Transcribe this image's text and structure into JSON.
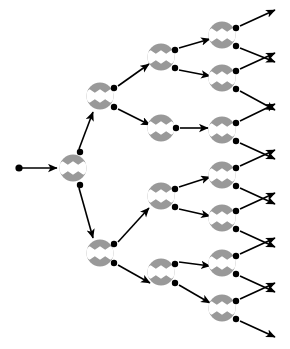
{
  "figure": {
    "width": 290,
    "height": 349,
    "background_color": "#ffffff"
  },
  "style": {
    "node_fill": "#999999",
    "node_band_color": "#ffffff",
    "port_dot_color": "#000000",
    "edge_color": "#000000",
    "node_radius": 13.5,
    "port_dot_radius": 3.2,
    "edge_width": 1.6,
    "band_half_height": 3.2,
    "zigzag_peaks": 3
  },
  "entry": {
    "label": "root-input",
    "dot": {
      "x": 19,
      "y": 168
    },
    "arrow_to": {
      "x": 56,
      "y": 168
    }
  },
  "nodes": [
    {
      "id": "n0",
      "label": "root-node",
      "depth": 0,
      "x": 73,
      "y": 168
    },
    {
      "id": "n1",
      "label": "node-upper",
      "depth": 1,
      "x": 100,
      "y": 96
    },
    {
      "id": "n2",
      "label": "node-lower",
      "depth": 1,
      "x": 100,
      "y": 253
    },
    {
      "id": "n3",
      "label": "node-d2-a",
      "depth": 2,
      "x": 161,
      "y": 57
    },
    {
      "id": "n4",
      "label": "node-d2-b",
      "depth": 2,
      "x": 161,
      "y": 128
    },
    {
      "id": "n5",
      "label": "node-d2-c",
      "depth": 2,
      "x": 161,
      "y": 196
    },
    {
      "id": "n6",
      "label": "node-d2-d",
      "depth": 2,
      "x": 161,
      "y": 272
    },
    {
      "id": "n7",
      "label": "node-leaf-1",
      "depth": 3,
      "x": 222,
      "y": 35
    },
    {
      "id": "n8",
      "label": "node-leaf-2",
      "depth": 3,
      "x": 222,
      "y": 78
    },
    {
      "id": "n9",
      "label": "node-leaf-3",
      "depth": 3,
      "x": 222,
      "y": 130
    },
    {
      "id": "n10",
      "label": "node-leaf-4",
      "depth": 3,
      "x": 222,
      "y": 175
    },
    {
      "id": "n11",
      "label": "node-leaf-5",
      "depth": 3,
      "x": 222,
      "y": 218
    },
    {
      "id": "n12",
      "label": "node-leaf-6",
      "depth": 3,
      "x": 222,
      "y": 263
    },
    {
      "id": "n13",
      "label": "node-leaf-7",
      "depth": 3,
      "x": 222,
      "y": 308
    }
  ],
  "ports": [
    {
      "id": "p0a",
      "label": "root-out-upper",
      "node": "n0",
      "x": 80,
      "y": 152
    },
    {
      "id": "p0b",
      "label": "root-out-lower",
      "node": "n0",
      "x": 80,
      "y": 185
    },
    {
      "id": "p1a",
      "label": "n1-out-upper",
      "node": "n1",
      "x": 114,
      "y": 88
    },
    {
      "id": "p1b",
      "label": "n1-out-lower",
      "node": "n1",
      "x": 114,
      "y": 107
    },
    {
      "id": "p2a",
      "label": "n2-out-upper",
      "node": "n2",
      "x": 114,
      "y": 244
    },
    {
      "id": "p2b",
      "label": "n2-out-lower",
      "node": "n2",
      "x": 114,
      "y": 263
    },
    {
      "id": "p3a",
      "label": "n3-out-upper",
      "node": "n3",
      "x": 175,
      "y": 50
    },
    {
      "id": "p3b",
      "label": "n3-out-lower",
      "node": "n3",
      "x": 175,
      "y": 68
    },
    {
      "id": "p4a",
      "label": "n4-out-single",
      "node": "n4",
      "x": 176,
      "y": 128
    },
    {
      "id": "p5a",
      "label": "n5-out-upper",
      "node": "n5",
      "x": 175,
      "y": 189
    },
    {
      "id": "p5b",
      "label": "n5-out-lower",
      "node": "n5",
      "x": 175,
      "y": 207
    },
    {
      "id": "p6a",
      "label": "n6-out-upper",
      "node": "n6",
      "x": 175,
      "y": 264
    },
    {
      "id": "p6b",
      "label": "n6-out-lower",
      "node": "n6",
      "x": 175,
      "y": 283
    },
    {
      "id": "p7a",
      "label": "n7-out-upper",
      "node": "n7",
      "x": 236,
      "y": 28
    },
    {
      "id": "p7b",
      "label": "n7-out-lower",
      "node": "n7",
      "x": 236,
      "y": 46
    },
    {
      "id": "p8a",
      "label": "n8-out-upper",
      "node": "n8",
      "x": 236,
      "y": 71
    },
    {
      "id": "p8b",
      "label": "n8-out-lower",
      "node": "n8",
      "x": 236,
      "y": 89
    },
    {
      "id": "p9a",
      "label": "n9-out-upper",
      "node": "n9",
      "x": 236,
      "y": 123
    },
    {
      "id": "p9b",
      "label": "n9-out-lower",
      "node": "n9",
      "x": 236,
      "y": 141
    },
    {
      "id": "p10a",
      "label": "n10-out-upper",
      "node": "n10",
      "x": 236,
      "y": 168
    },
    {
      "id": "p10b",
      "label": "n10-out-lower",
      "node": "n10",
      "x": 236,
      "y": 186
    },
    {
      "id": "p11a",
      "label": "n11-out-upper",
      "node": "n11",
      "x": 236,
      "y": 211
    },
    {
      "id": "p11b",
      "label": "n11-out-lower",
      "node": "n11",
      "x": 236,
      "y": 229
    },
    {
      "id": "p12a",
      "label": "n12-out-upper",
      "node": "n12",
      "x": 236,
      "y": 256
    },
    {
      "id": "p12b",
      "label": "n12-out-lower",
      "node": "n12",
      "x": 236,
      "y": 274
    },
    {
      "id": "p13a",
      "label": "n13-out-upper",
      "node": "n13",
      "x": 236,
      "y": 301
    },
    {
      "id": "p13b",
      "label": "n13-out-lower",
      "node": "n13",
      "x": 236,
      "y": 319
    }
  ],
  "edges": [
    {
      "id": "e-root-in",
      "label": "edge-input-to-root",
      "from": {
        "x": 22,
        "y": 168
      },
      "to": {
        "x": 57,
        "y": 168
      }
    },
    {
      "id": "e0a",
      "label": "edge-root-to-n1",
      "from": {
        "x": 79,
        "y": 149
      },
      "to": {
        "x": 93,
        "y": 112
      }
    },
    {
      "id": "e0b",
      "label": "edge-root-to-n2",
      "from": {
        "x": 79,
        "y": 188
      },
      "to": {
        "x": 93,
        "y": 238
      }
    },
    {
      "id": "e1a",
      "label": "edge-n1-to-n3",
      "from": {
        "x": 118,
        "y": 86
      },
      "to": {
        "x": 149,
        "y": 64
      }
    },
    {
      "id": "e1b",
      "label": "edge-n1-to-n4",
      "from": {
        "x": 118,
        "y": 109
      },
      "to": {
        "x": 150,
        "y": 125
      }
    },
    {
      "id": "e2a",
      "label": "edge-n2-to-n5",
      "from": {
        "x": 118,
        "y": 242
      },
      "to": {
        "x": 149,
        "y": 208
      }
    },
    {
      "id": "e2b",
      "label": "edge-n2-to-n6",
      "from": {
        "x": 118,
        "y": 265
      },
      "to": {
        "x": 150,
        "y": 283
      }
    },
    {
      "id": "e3a",
      "label": "edge-n3-to-n7",
      "from": {
        "x": 179,
        "y": 48
      },
      "to": {
        "x": 210,
        "y": 39
      }
    },
    {
      "id": "e3b",
      "label": "edge-n3-to-n8",
      "from": {
        "x": 179,
        "y": 70
      },
      "to": {
        "x": 210,
        "y": 76
      }
    },
    {
      "id": "e4a",
      "label": "edge-n4-to-n9",
      "from": {
        "x": 180,
        "y": 128
      },
      "to": {
        "x": 208,
        "y": 128
      }
    },
    {
      "id": "e5a",
      "label": "edge-n5-to-n10",
      "from": {
        "x": 179,
        "y": 187
      },
      "to": {
        "x": 210,
        "y": 177
      }
    },
    {
      "id": "e5b",
      "label": "edge-n5-to-n11",
      "from": {
        "x": 179,
        "y": 209
      },
      "to": {
        "x": 210,
        "y": 216
      }
    },
    {
      "id": "e6a",
      "label": "edge-n6-to-n12",
      "from": {
        "x": 179,
        "y": 262
      },
      "to": {
        "x": 210,
        "y": 266
      }
    },
    {
      "id": "e6b",
      "label": "edge-n6-to-n13",
      "from": {
        "x": 179,
        "y": 285
      },
      "to": {
        "x": 210,
        "y": 303
      }
    },
    {
      "id": "e7a",
      "label": "edge-n7-out-upper",
      "from": {
        "x": 240,
        "y": 26
      },
      "to": {
        "x": 275,
        "y": 10
      }
    },
    {
      "id": "e7b",
      "label": "edge-n7-out-lower",
      "from": {
        "x": 240,
        "y": 48
      },
      "to": {
        "x": 275,
        "y": 62
      }
    },
    {
      "id": "e8a",
      "label": "edge-n8-out-upper",
      "from": {
        "x": 240,
        "y": 69
      },
      "to": {
        "x": 275,
        "y": 53
      }
    },
    {
      "id": "e8b",
      "label": "edge-n8-out-lower",
      "from": {
        "x": 240,
        "y": 91
      },
      "to": {
        "x": 275,
        "y": 110
      }
    },
    {
      "id": "e9a",
      "label": "edge-n9-out-upper",
      "from": {
        "x": 240,
        "y": 121
      },
      "to": {
        "x": 275,
        "y": 104
      }
    },
    {
      "id": "e9b",
      "label": "edge-n9-out-lower",
      "from": {
        "x": 240,
        "y": 143
      },
      "to": {
        "x": 275,
        "y": 159
      }
    },
    {
      "id": "e10a",
      "label": "edge-n10-out-upper",
      "from": {
        "x": 240,
        "y": 166
      },
      "to": {
        "x": 275,
        "y": 150
      }
    },
    {
      "id": "e10b",
      "label": "edge-n10-out-lower",
      "from": {
        "x": 240,
        "y": 188
      },
      "to": {
        "x": 275,
        "y": 204
      }
    },
    {
      "id": "e11a",
      "label": "edge-n11-out-upper",
      "from": {
        "x": 240,
        "y": 209
      },
      "to": {
        "x": 275,
        "y": 193
      }
    },
    {
      "id": "e11b",
      "label": "edge-n11-out-lower",
      "from": {
        "x": 240,
        "y": 231
      },
      "to": {
        "x": 275,
        "y": 247
      }
    },
    {
      "id": "e12a",
      "label": "edge-n12-out-upper",
      "from": {
        "x": 240,
        "y": 254
      },
      "to": {
        "x": 275,
        "y": 238
      }
    },
    {
      "id": "e12b",
      "label": "edge-n12-out-lower",
      "from": {
        "x": 240,
        "y": 276
      },
      "to": {
        "x": 275,
        "y": 292
      }
    },
    {
      "id": "e13a",
      "label": "edge-n13-out-upper",
      "from": {
        "x": 240,
        "y": 299
      },
      "to": {
        "x": 275,
        "y": 283
      }
    },
    {
      "id": "e13b",
      "label": "edge-n13-out-lower",
      "from": {
        "x": 240,
        "y": 321
      },
      "to": {
        "x": 275,
        "y": 337
      }
    }
  ]
}
